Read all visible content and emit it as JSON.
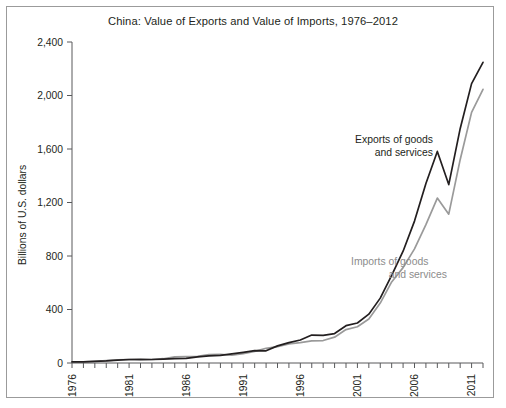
{
  "figure": {
    "background_color": "#ffffff",
    "frame_color": "#9b9b9b"
  },
  "chart_data": {
    "type": "line",
    "title": "China: Value of Exports and Value of Imports, 1976–2012",
    "xlabel": "",
    "ylabel": "Billions of U.S. dollars",
    "xlim": [
      1976,
      2012
    ],
    "ylim": [
      0,
      2400
    ],
    "yticks": [
      0,
      400,
      800,
      1200,
      1600,
      2000,
      2400
    ],
    "ytick_labels": [
      "0",
      "400",
      "800",
      "1,200",
      "1,600",
      "2,000",
      "2,400"
    ],
    "xticks": [
      1976,
      1981,
      1986,
      1991,
      1996,
      2001,
      2006,
      2011
    ],
    "xtick_labels": [
      "1976",
      "1981",
      "1986",
      "1991",
      "1996",
      "2001",
      "2006",
      "2011"
    ],
    "xtick_rotation": 90,
    "minor_xticks_every": 1,
    "grid": false,
    "legend_position": "inline-annotation",
    "x": [
      1976,
      1977,
      1978,
      1979,
      1980,
      1981,
      1982,
      1983,
      1984,
      1985,
      1986,
      1987,
      1988,
      1989,
      1990,
      1991,
      1992,
      1993,
      1994,
      1995,
      1996,
      1997,
      1998,
      1999,
      2000,
      2001,
      2002,
      2003,
      2004,
      2005,
      2006,
      2007,
      2008,
      2009,
      2010,
      2011,
      2012
    ],
    "series": [
      {
        "name": "Exports of goods and services",
        "color": "#231f20",
        "label_lines": [
          "Exports of goods",
          "and services"
        ],
        "values": [
          8,
          9,
          12,
          16,
          22,
          26,
          27,
          26,
          29,
          32,
          35,
          46,
          54,
          57,
          68,
          80,
          92,
          91,
          128,
          152,
          172,
          209,
          207,
          220,
          279,
          299,
          365,
          485,
          655,
          836,
          1061,
          1342,
          1582,
          1334,
          1752,
          2089,
          2248
        ]
      },
      {
        "name": "Imports of goods and services",
        "color": "#9a9a9a",
        "label_lines": [
          "Imports of goods",
          "and services"
        ],
        "values": [
          7,
          8,
          13,
          18,
          23,
          26,
          23,
          26,
          32,
          46,
          47,
          49,
          63,
          65,
          58,
          70,
          87,
          110,
          123,
          143,
          153,
          166,
          168,
          193,
          250,
          271,
          329,
          448,
          606,
          713,
          853,
          1034,
          1233,
          1113,
          1520,
          1874,
          2046
        ]
      }
    ]
  },
  "geometry": {
    "plot_left": 72,
    "plot_right": 483,
    "plot_bottom": 363,
    "plot_top": 42,
    "label_exports_x": 433,
    "label_exports_y": 143,
    "label_imports_x": 351,
    "label_imports_y": 265
  }
}
